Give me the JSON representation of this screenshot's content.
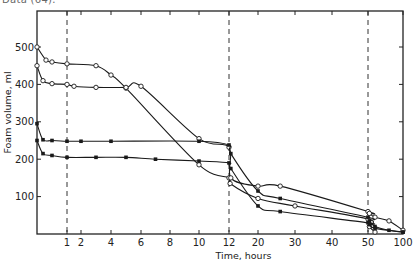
{
  "caption_fragment": "Data (64).",
  "chart_data": {
    "type": "line",
    "title": "",
    "xlabel": "Time, hours",
    "ylabel": "Foam volume, ml",
    "x_scale": "piecewise (0–12 linear-ish, then 12, 20, 30, 40, 50, 100 compressed)",
    "x_ticks": [
      "1",
      "2",
      "4",
      "6",
      "8",
      "10",
      "12",
      "20",
      "30",
      "40",
      "50",
      "100"
    ],
    "y_ticks": [
      "100",
      "200",
      "300",
      "400",
      "500"
    ],
    "ylim": [
      0,
      580
    ],
    "grid": false,
    "reference_lines_x": [
      1,
      12,
      50
    ],
    "series": [
      {
        "name": "Series A (open circles, from 500)",
        "marker": "open-circle",
        "points": [
          [
            0,
            500
          ],
          [
            0.3,
            465
          ],
          [
            0.5,
            460
          ],
          [
            1,
            455
          ],
          [
            3,
            450
          ],
          [
            4,
            425
          ],
          [
            5,
            390
          ],
          [
            10,
            185
          ],
          [
            12,
            150
          ],
          [
            12.3,
            135
          ],
          [
            20,
            95
          ],
          [
            30,
            75
          ],
          [
            50,
            40
          ],
          [
            52,
            20
          ],
          [
            60,
            5
          ]
        ]
      },
      {
        "name": "Series B (open circles, from 450)",
        "marker": "open-circle",
        "points": [
          [
            0,
            450
          ],
          [
            0.2,
            410
          ],
          [
            0.5,
            402
          ],
          [
            1,
            400
          ],
          [
            1.5,
            395
          ],
          [
            3,
            392
          ],
          [
            5,
            392
          ],
          [
            6,
            395
          ],
          [
            10,
            255
          ],
          [
            12,
            232
          ],
          [
            12.5,
            150
          ],
          [
            20,
            128
          ],
          [
            26,
            128
          ],
          [
            50,
            60
          ],
          [
            52,
            55
          ],
          [
            60,
            45
          ],
          [
            80,
            35
          ],
          [
            100,
            10
          ]
        ]
      },
      {
        "name": "Series C (filled squares, from 300)",
        "marker": "filled-square",
        "points": [
          [
            0,
            295
          ],
          [
            0.2,
            252
          ],
          [
            0.5,
            250
          ],
          [
            1,
            248
          ],
          [
            2,
            248
          ],
          [
            4,
            248
          ],
          [
            10,
            248
          ],
          [
            12,
            238
          ],
          [
            12.5,
            215
          ],
          [
            20,
            115
          ],
          [
            26,
            95
          ],
          [
            50,
            45
          ],
          [
            52,
            35
          ],
          [
            60,
            20
          ],
          [
            80,
            10
          ],
          [
            100,
            5
          ]
        ]
      },
      {
        "name": "Series D (filled squares, from 250)",
        "marker": "filled-square",
        "points": [
          [
            0,
            250
          ],
          [
            0.2,
            215
          ],
          [
            0.5,
            210
          ],
          [
            1,
            205
          ],
          [
            3,
            205
          ],
          [
            5,
            205
          ],
          [
            7,
            200
          ],
          [
            10,
            195
          ],
          [
            12,
            190
          ],
          [
            12.5,
            175
          ],
          [
            20,
            75
          ],
          [
            26,
            60
          ],
          [
            50,
            30
          ],
          [
            52,
            25
          ],
          [
            60,
            15
          ],
          [
            100,
            5
          ]
        ]
      }
    ]
  }
}
